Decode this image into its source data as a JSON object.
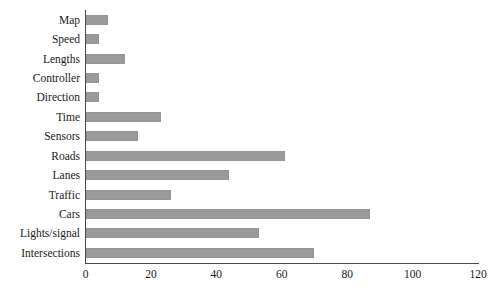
{
  "chart_data": {
    "type": "bar",
    "orientation": "horizontal",
    "title": "",
    "subtitle": "",
    "xlabel": "",
    "ylabel": "",
    "xlim": [
      0,
      120
    ],
    "xticks": [
      0,
      20,
      40,
      60,
      80,
      100,
      120
    ],
    "grid": false,
    "legend": null,
    "legend_position": "none",
    "bar_color": "#9a9a9a",
    "axis_color": "#4a4a4a",
    "background_color": "#ffffff",
    "categories": [
      "Map",
      "Speed",
      "Lengths",
      "Controller",
      "Direction",
      "Time",
      "Sensors",
      "Roads",
      "Lanes",
      "Traffic",
      "Cars",
      "Lights/signal",
      "Intersections"
    ],
    "values": [
      7,
      4,
      12,
      4,
      4,
      23,
      16,
      61,
      44,
      26,
      87,
      53,
      70
    ]
  }
}
